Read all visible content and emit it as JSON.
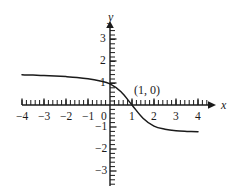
{
  "figure": {
    "background_color": "#ffffff",
    "ink_color": "#1a1a1a",
    "width": 243,
    "height": 192
  },
  "axes": {
    "x_name": "x",
    "y_name": "y",
    "origin_px": {
      "x": 110,
      "y": 105
    },
    "unit_px": 22,
    "minor_ticks_per_unit": 5,
    "x_axis_start_px": 22,
    "x_axis_end_px": 214,
    "y_axis_top_px": 22,
    "y_axis_bottom_px": 186,
    "x_tick_labels": [
      {
        "text": "−4",
        "value": -4
      },
      {
        "text": "−3",
        "value": -3
      },
      {
        "text": "−2",
        "value": -2
      },
      {
        "text": "−1",
        "value": -1
      },
      {
        "text": "0",
        "value": 0
      },
      {
        "text": "1",
        "value": 1
      },
      {
        "text": "2",
        "value": 2
      },
      {
        "text": "3",
        "value": 3
      },
      {
        "text": "4",
        "value": 4
      }
    ],
    "y_tick_labels": [
      {
        "text": "3",
        "value": 3
      },
      {
        "text": "2",
        "value": 2
      },
      {
        "text": "1",
        "value": 1
      },
      {
        "text": "−1",
        "value": -1
      },
      {
        "text": "−2",
        "value": -2
      },
      {
        "text": "−3",
        "value": -3
      }
    ]
  },
  "annotations": [
    {
      "name": "x-intercept-label",
      "text": "(1, 0)",
      "left_px": 134,
      "top_px": 84
    }
  ],
  "chart_data": {
    "type": "line",
    "title": "",
    "xlabel": "x",
    "ylabel": "y",
    "xlim": [
      -4,
      4
    ],
    "ylim": [
      -3,
      3
    ],
    "grid": false,
    "legend": "none",
    "annotations": [
      "(1, 0)"
    ],
    "series": [
      {
        "name": "curve",
        "x": [
          -4.0,
          -3.5,
          -3.0,
          -2.5,
          -2.0,
          -1.5,
          -1.0,
          -0.5,
          0.0,
          0.5,
          1.0,
          1.5,
          2.0,
          2.5,
          3.0,
          3.5,
          4.0
        ],
        "y": [
          1.37,
          1.36,
          1.34,
          1.32,
          1.29,
          1.25,
          1.19,
          1.1,
          0.96,
          0.6,
          0.0,
          -0.6,
          -0.96,
          -1.1,
          -1.17,
          -1.2,
          -1.22
        ]
      }
    ]
  }
}
